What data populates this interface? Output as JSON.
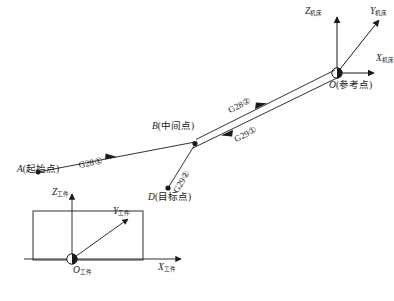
{
  "figure": {
    "ink_color": "#1a1a1a",
    "background": "#ffffff"
  },
  "points": {
    "start": {
      "id": "A",
      "label": "A(起始点)",
      "name": "起始点",
      "x": 38,
      "y": 172
    },
    "intermediate": {
      "id": "B",
      "label": "B(中间点)",
      "name": "中间点",
      "x": 195,
      "y": 142
    },
    "target": {
      "id": "D",
      "label": "D(目标点)",
      "name": "目标点",
      "x": 168,
      "y": 188
    },
    "reference": {
      "id": "O",
      "label": "O(参考点)",
      "name": "参考点",
      "x": 337,
      "y": 73
    },
    "workpiece_origin": {
      "id": "O",
      "label": "O",
      "subscript": "工件",
      "x": 72,
      "y": 259
    }
  },
  "paths": [
    {
      "from": "A",
      "to": "B",
      "code": "G28",
      "order": "①",
      "label": "G28①"
    },
    {
      "from": "B",
      "to": "O",
      "code": "G28",
      "order": "②",
      "label": "G28②"
    },
    {
      "from": "O",
      "to": "B",
      "code": "G29",
      "order": "①",
      "label": "G29①"
    },
    {
      "from": "B",
      "to": "D",
      "code": "G29",
      "order": "②",
      "label": "G29②"
    }
  ],
  "machine_axes": {
    "subscript": "机床",
    "z": {
      "letter": "Z",
      "label": "Z机床"
    },
    "y": {
      "letter": "Y",
      "label": "Y机床"
    },
    "x": {
      "letter": "X",
      "label": "X机床"
    }
  },
  "workpiece_axes": {
    "subscript": "工件",
    "z": {
      "letter": "Z",
      "label": "Z工件"
    },
    "y": {
      "letter": "Y",
      "label": "Y工件"
    },
    "x": {
      "letter": "X",
      "label": "X工件"
    },
    "origin": {
      "letter": "O",
      "label": "O工件"
    }
  }
}
